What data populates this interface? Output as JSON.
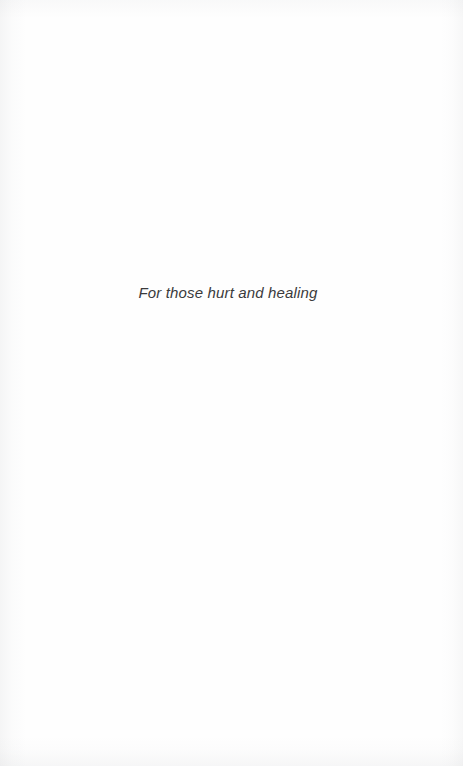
{
  "page": {
    "kind": "book-dedication-page",
    "background_color": "#fefefe",
    "text_color": "#3a3a3c"
  },
  "dedication": {
    "line": "For those hurt and healing"
  }
}
